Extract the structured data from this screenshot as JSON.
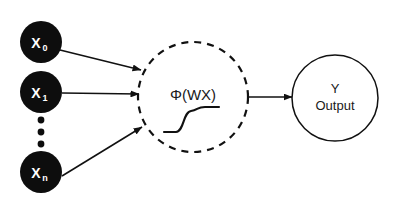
{
  "diagram": {
    "background_color": "#ffffff",
    "stroke_color": "#111111",
    "node_fill_color": "#0d0d0d",
    "node_text_color": "#ffffff",
    "input_nodes": [
      {
        "id": "x0",
        "base": "X",
        "subscript": "0",
        "cx": 41,
        "cy": 42,
        "r": 21
      },
      {
        "id": "x1",
        "base": "X",
        "subscript": "1",
        "cx": 41,
        "cy": 92,
        "r": 21
      },
      {
        "id": "xn",
        "base": "X",
        "subscript": "n",
        "cx": 41,
        "cy": 172,
        "r": 21
      }
    ],
    "ellipsis": {
      "name": "vertical-ellipsis",
      "dots": 3,
      "cx": 41,
      "dot_ys": [
        120,
        132,
        144
      ],
      "dot_r": 3.4
    },
    "activation_unit": {
      "label": "Φ(WX)",
      "cx": 193,
      "cy": 97,
      "r": 55,
      "border_style": "dashed",
      "curve_name": "sigmoid-curve"
    },
    "output_node": {
      "line1": "Y",
      "line2": "Output",
      "cx": 335,
      "cy": 98,
      "r": 43,
      "border_style": "solid"
    },
    "edges": [
      {
        "name": "edge-x0-to-activation",
        "from": "x0",
        "to": "activation"
      },
      {
        "name": "edge-x1-to-activation",
        "from": "x1",
        "to": "activation"
      },
      {
        "name": "edge-xn-to-activation",
        "from": "xn",
        "to": "activation"
      },
      {
        "name": "edge-activation-to-output",
        "from": "activation",
        "to": "output"
      }
    ]
  }
}
